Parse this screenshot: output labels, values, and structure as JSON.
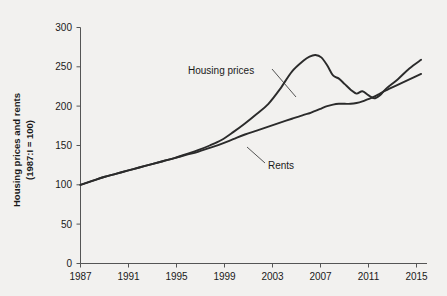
{
  "chart_data": {
    "type": "line",
    "title": "",
    "xlabel": "",
    "ylabel": "Housing prices and rents\n(1987:I = 100)",
    "ylabel_line1": "Housing prices and rents",
    "ylabel_line2": "(1987:I = 100)",
    "xlim": [
      1987,
      2016.5
    ],
    "ylim": [
      0,
      300
    ],
    "grid": false,
    "legend_position": "inline-annotations",
    "yticks": [
      0,
      50,
      100,
      150,
      200,
      250,
      300
    ],
    "ytick_labels": [
      "0",
      "50",
      "100",
      "150",
      "200",
      "250",
      "300"
    ],
    "xticks": [
      1987,
      1991,
      1995,
      1999,
      2003,
      2007,
      2011,
      2015
    ],
    "xtick_labels": [
      "1987",
      "1991",
      "1995",
      "1999",
      "2003",
      "2007",
      "2011",
      "2015"
    ],
    "x": [
      1987,
      1988,
      1989,
      1990,
      1991,
      1992,
      1993,
      1994,
      1995,
      1996,
      1997,
      1998,
      1999,
      2000,
      2001,
      2002,
      2003,
      2004,
      2005,
      2006,
      2006.5,
      2007,
      2007.5,
      2008,
      2008.5,
      2009,
      2009.5,
      2010,
      2010.5,
      2011,
      2011.5,
      2012,
      2012.5,
      2013,
      2014,
      2015,
      2016
    ],
    "series": [
      {
        "name": "Housing prices",
        "label": "Housing prices",
        "color": "#2b2b2b",
        "values": [
          100,
          105,
          110,
          114,
          118,
          122,
          126,
          130,
          134,
          139,
          144,
          150,
          157,
          167,
          178,
          190,
          203,
          222,
          244,
          258,
          263,
          265,
          262,
          252,
          239,
          235,
          228,
          221,
          216,
          219,
          214,
          210,
          214,
          222,
          234,
          248,
          259
        ]
      },
      {
        "name": "Rents",
        "label": "Rents",
        "color": "#2b2b2b",
        "values": [
          100,
          105,
          110,
          114,
          118,
          122,
          126,
          130,
          134,
          138,
          142,
          147,
          152,
          158,
          164,
          169,
          174,
          179,
          184,
          189,
          191,
          194,
          197,
          200,
          202,
          203,
          203,
          203,
          204,
          206,
          209,
          212,
          216,
          220,
          227,
          234,
          241
        ]
      }
    ],
    "annotations": [
      {
        "text": "Housing prices",
        "x_px": 188,
        "y_px": 71,
        "leader_from": [
          272,
          69
        ],
        "leader_to": [
          295,
          96
        ]
      },
      {
        "text": "Rents",
        "x_px": 265,
        "y_px": 165,
        "leader_from": [
          263,
          162
        ],
        "leader_to": [
          247,
          147
        ]
      }
    ]
  }
}
